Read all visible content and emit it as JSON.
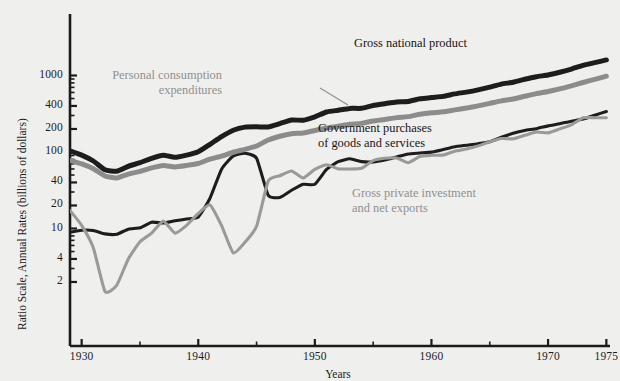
{
  "chart_data": {
    "type": "line",
    "title": "",
    "xlabel": "Years",
    "ylabel": "Ratio Scale, Annual Rates (billions of dollars)",
    "scale": "log",
    "grid": false,
    "legend_position": "inline-annotations",
    "xlim": [
      1929,
      1975
    ],
    "ylim": [
      2,
      1400
    ],
    "x_ticks_major": [
      1930,
      1940,
      1950,
      1960,
      1970,
      1975
    ],
    "x_tick_labels": [
      "1930",
      "1940",
      "1950",
      "1960",
      "1970",
      "1975"
    ],
    "x_ticks_minor": [
      1935,
      1945,
      1955,
      1965
    ],
    "y_ticks": [
      2,
      4,
      10,
      20,
      40,
      100,
      200,
      400,
      1000
    ],
    "y_tick_labels": [
      "2",
      "4",
      "10",
      "20",
      "40",
      "100",
      "200",
      "400",
      "1000"
    ],
    "series": [
      {
        "name": "Gross national product",
        "color": "#1d1d1d",
        "width": 5.0,
        "x": [
          1929,
          1930,
          1931,
          1932,
          1933,
          1934,
          1935,
          1936,
          1937,
          1938,
          1939,
          1940,
          1941,
          1942,
          1943,
          1944,
          1945,
          1946,
          1947,
          1948,
          1949,
          1950,
          1951,
          1952,
          1953,
          1954,
          1955,
          1956,
          1957,
          1958,
          1959,
          1960,
          1961,
          1962,
          1963,
          1964,
          1965,
          1966,
          1967,
          1968,
          1969,
          1970,
          1971,
          1972,
          1973,
          1974,
          1975
        ],
        "y": [
          103.4,
          91.1,
          76.3,
          58.5,
          56.0,
          65.0,
          72.5,
          82.7,
          90.8,
          85.2,
          91.1,
          100.6,
          125.8,
          159.1,
          192.7,
          211.4,
          213.4,
          212.4,
          235.2,
          261.6,
          260.4,
          288.3,
          333.4,
          351.6,
          371.6,
          372.5,
          405.9,
          428.2,
          451.0,
          456.8,
          495.8,
          515.3,
          533.8,
          574.6,
          606.9,
          649.8,
          705.1,
          772.0,
          816.4,
          892.7,
          963.9,
          1015.5,
          1102.7,
          1212.8,
          1359.3,
          1472.8,
          1598.4
        ],
        "units": "billions of dollars"
      },
      {
        "name": "Personal consumption expenditures",
        "color": "#8c8c8c",
        "width": 5.0,
        "x": [
          1929,
          1930,
          1931,
          1932,
          1933,
          1934,
          1935,
          1936,
          1937,
          1938,
          1939,
          1940,
          1941,
          1942,
          1943,
          1944,
          1945,
          1946,
          1947,
          1948,
          1949,
          1950,
          1951,
          1952,
          1953,
          1954,
          1955,
          1956,
          1957,
          1958,
          1959,
          1960,
          1961,
          1962,
          1963,
          1964,
          1965,
          1966,
          1967,
          1968,
          1969,
          1970,
          1971,
          1972,
          1973,
          1974,
          1975
        ],
        "y": [
          77.2,
          69.9,
          60.5,
          48.6,
          45.8,
          51.3,
          55.7,
          61.9,
          66.5,
          63.9,
          66.8,
          70.8,
          80.6,
          88.5,
          99.3,
          108.3,
          119.7,
          143.4,
          160.7,
          173.6,
          176.8,
          191.0,
          206.3,
          216.7,
          230.0,
          236.5,
          254.4,
          266.7,
          281.4,
          290.1,
          311.2,
          325.2,
          335.2,
          355.1,
          375.0,
          401.2,
          432.8,
          466.3,
          492.1,
          536.2,
          579.5,
          618.0,
          668.1,
          733.0,
          809.9,
          889.6,
          979.1
        ],
        "units": "billions of dollars"
      },
      {
        "name": "Government purchases of goods and services",
        "color": "#1d1d1d",
        "width": 3.1,
        "x": [
          1929,
          1930,
          1931,
          1932,
          1933,
          1934,
          1935,
          1936,
          1937,
          1938,
          1939,
          1940,
          1941,
          1942,
          1943,
          1944,
          1945,
          1946,
          1947,
          1948,
          1949,
          1950,
          1951,
          1952,
          1953,
          1954,
          1955,
          1956,
          1957,
          1958,
          1959,
          1960,
          1961,
          1962,
          1963,
          1964,
          1965,
          1966,
          1967,
          1968,
          1969,
          1970,
          1971,
          1972,
          1973,
          1974,
          1975
        ],
        "y": [
          8.9,
          9.5,
          9.4,
          8.5,
          8.4,
          9.8,
          10.2,
          12.1,
          11.8,
          12.6,
          13.3,
          14.1,
          24.8,
          59.7,
          88.6,
          96.5,
          83.0,
          27.2,
          25.5,
          31.6,
          37.8,
          37.9,
          59.1,
          74.7,
          81.6,
          74.8,
          74.2,
          78.6,
          86.1,
          94.2,
          97.0,
          99.6,
          107.6,
          117.1,
          122.5,
          128.4,
          136.3,
          155.9,
          175.6,
          191.5,
          201.8,
          219.5,
          234.2,
          253.1,
          269.2,
          302.7,
          338.4
        ],
        "units": "billions of dollars"
      },
      {
        "name": "Gross private investment and net exports",
        "color": "#9a9a9a",
        "width": 3.1,
        "x": [
          1929,
          1930,
          1931,
          1932,
          1933,
          1934,
          1935,
          1936,
          1937,
          1938,
          1939,
          1940,
          1941,
          1942,
          1943,
          1944,
          1945,
          1946,
          1947,
          1948,
          1949,
          1950,
          1951,
          1952,
          1953,
          1954,
          1955,
          1956,
          1957,
          1958,
          1959,
          1960,
          1961,
          1962,
          1963,
          1964,
          1965,
          1966,
          1967,
          1968,
          1969,
          1970,
          1971,
          1972,
          1973,
          1974,
          1975
        ],
        "y": [
          17.2,
          11.0,
          5.6,
          1.5,
          1.8,
          4.0,
          6.7,
          8.7,
          12.5,
          8.7,
          11.0,
          15.7,
          20.4,
          10.9,
          4.8,
          6.6,
          10.7,
          41.8,
          49.0,
          56.4,
          45.8,
          59.4,
          68.0,
          60.2,
          60.0,
          61.2,
          77.3,
          82.9,
          83.5,
          72.5,
          87.6,
          90.5,
          91.0,
          102.4,
          109.4,
          120.2,
          136.0,
          149.8,
          148.7,
          165.0,
          182.6,
          178.0,
          200.4,
          226.7,
          280.2,
          280.5,
          280.9
        ],
        "units": "billions of dollars"
      }
    ],
    "annotations": [
      {
        "id": "gnp-label",
        "text_lines": [
          "Gross national product"
        ],
        "color": "#151515",
        "align": "left",
        "x_px": 354,
        "y_px": 36,
        "leader": null
      },
      {
        "id": "pce-label",
        "text_lines": [
          "Personal consumption",
          "expenditures"
        ],
        "color": "#8f8f8f",
        "align": "right",
        "x_px": 222,
        "y_px": 68,
        "leader": {
          "x1": 320,
          "y1": 88,
          "x2": 348,
          "y2": 105
        }
      },
      {
        "id": "gov-label",
        "text_lines": [
          "Government purchases",
          "of goods and services"
        ],
        "color": "#151515",
        "align": "left",
        "x_px": 318,
        "y_px": 121,
        "leader": null
      },
      {
        "id": "gpi-label",
        "text_lines": [
          "Gross private investment",
          "and net exports"
        ],
        "color": "#8f8f8f",
        "align": "left",
        "x_px": 352,
        "y_px": 186,
        "leader": null
      }
    ]
  },
  "geometry": {
    "plot_left_px": 70,
    "plot_right_px": 606,
    "plot_bottom_px": 346,
    "axis_top_px": 14,
    "px_per_year": 11.66,
    "log_ref_value": 100,
    "log_ref_y_px": 152,
    "log_px_per_decade": 76.5
  },
  "colors": {
    "background": "#efefed",
    "axis": "#1b1b1b",
    "dark_series": "#1d1d1d",
    "gray_series": "#8c8c8c",
    "light_gray_series": "#9a9a9a",
    "text": "#1b1b1b",
    "gray_text": "#8f8f8f"
  }
}
